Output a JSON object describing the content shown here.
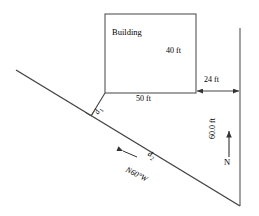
{
  "figure": {
    "title_hidden": "surveying diagram of a building offset from a property line",
    "stroke_color": "#333333",
    "background": "#ffffff"
  },
  "building": {
    "label": "Building",
    "width_label": "50 ft",
    "height_label": "40 ft"
  },
  "measurements": {
    "offset_to_line": "24 ft",
    "vertical_distance": "60.0 ft"
  },
  "distances": {
    "d1_letter": "d",
    "d1_subscript": "1",
    "d2_letter": "d",
    "d2_subscript": "2"
  },
  "bearing": {
    "label": "N60°W"
  },
  "compass": {
    "north_label": "N"
  }
}
